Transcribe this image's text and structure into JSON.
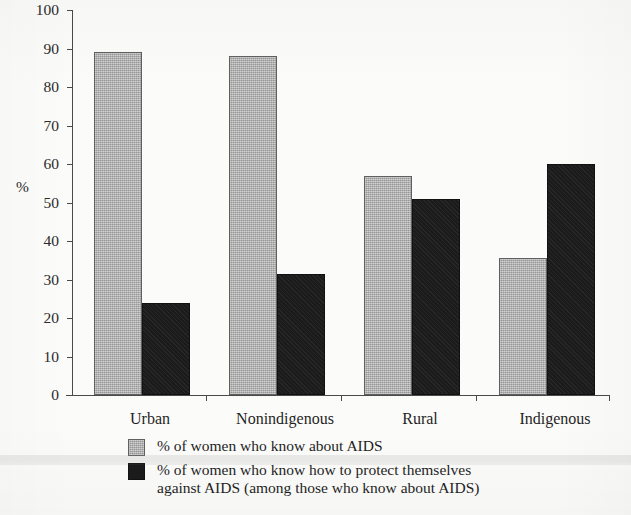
{
  "chart_data": {
    "type": "bar",
    "title": "",
    "xlabel": "",
    "ylabel": "%",
    "ylim": [
      0,
      100
    ],
    "ytick_step": 10,
    "yticks": [
      0,
      10,
      20,
      30,
      40,
      50,
      60,
      70,
      80,
      90,
      100
    ],
    "ytick_labels": [
      "0",
      "10",
      "20",
      "30",
      "40",
      "50",
      "60",
      "70",
      "80",
      "90",
      "100"
    ],
    "grid": false,
    "legend_position": "bottom",
    "categories": [
      "Urban",
      "Nonindigenous",
      "Rural",
      "Indigenous"
    ],
    "series": [
      {
        "name": "% of women who know about AIDS",
        "color": "#a9a9a9",
        "values": [
          89,
          88,
          57,
          35.5
        ]
      },
      {
        "name": "% of women who know how to protect themselves against AIDS (among those who know about AIDS)",
        "color": "#1b1b1b",
        "values": [
          24,
          31.5,
          51,
          60
        ]
      }
    ]
  },
  "axis": {
    "y_axis_title": "%",
    "tick_labels": [
      "100",
      "90",
      "80",
      "70",
      "60",
      "50",
      "40",
      "30",
      "20",
      "10",
      "0"
    ]
  },
  "categories": [
    {
      "label": "Urban"
    },
    {
      "label": "Nonindigenous"
    },
    {
      "label": "Rural"
    },
    {
      "label": "Indigenous"
    }
  ],
  "legend": {
    "items": [
      {
        "swatch": "light-gray-swatch",
        "line1": "% of women who know about AIDS",
        "line2": ""
      },
      {
        "swatch": "black-swatch",
        "line1": "% of women who know how to protect themselves",
        "line2": "against AIDS (among those who know about AIDS)"
      }
    ]
  }
}
